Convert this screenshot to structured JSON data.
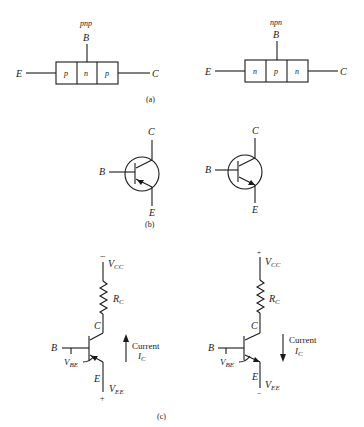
{
  "figure": {
    "part_a": {
      "caption": "(a)",
      "pnp": {
        "type_label": "pnp",
        "base": "B",
        "emitter": "E",
        "collector": "C",
        "regions": [
          "p",
          "n",
          "p"
        ]
      },
      "npn": {
        "type_label": "npn",
        "base": "B",
        "emitter": "E",
        "collector": "C",
        "regions": [
          "n",
          "p",
          "n"
        ]
      }
    },
    "part_b": {
      "caption": "(b)",
      "pnp_symbol": {
        "collector": "C",
        "base": "B",
        "emitter": "E"
      },
      "npn_symbol": {
        "collector": "C",
        "base": "B",
        "emitter": "E"
      }
    },
    "part_c": {
      "caption": "(c)",
      "pnp_circuit": {
        "supply_polarity_top": "−",
        "vcc": "V",
        "vcc_sub": "CC",
        "rc": "R",
        "rc_sub": "C",
        "collector": "C",
        "base": "B",
        "vbe": "V",
        "vbe_sub": "BE",
        "emitter": "E",
        "vee": "V",
        "vee_sub": "EE",
        "supply_polarity_bottom": "+",
        "current_word": "Current",
        "current": "I",
        "current_sub": "C",
        "current_direction": "up"
      },
      "npn_circuit": {
        "supply_polarity_top": "+",
        "vcc": "V",
        "vcc_sub": "CC",
        "rc": "R",
        "rc_sub": "C",
        "collector": "C",
        "base": "B",
        "vbe": "V",
        "vbe_sub": "BE",
        "emitter": "E",
        "vee": "V",
        "vee_sub": "EE",
        "supply_polarity_bottom": "−",
        "current_word": "Current",
        "current": "I",
        "current_sub": "C",
        "current_direction": "down"
      }
    }
  }
}
